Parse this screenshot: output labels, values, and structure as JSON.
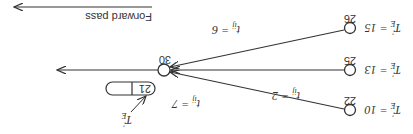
{
  "diagram": {
    "orientation": "rotated 180 degrees",
    "header": {
      "label": "Forward pass"
    },
    "target_node": {
      "id": "30"
    },
    "source_nodes": [
      {
        "id": "22",
        "te_label": "T'E = 10",
        "te_value": "10",
        "edge_label": "tij = 7",
        "duration": "7"
      },
      {
        "id": "25",
        "te_label": "T'E = 13",
        "te_value": "13",
        "edge_label": "tij = 2",
        "duration": "2"
      },
      {
        "id": "26",
        "te_label": "T'E = 15",
        "te_value": "15",
        "edge_label": "tij = 6",
        "duration": "6"
      }
    ],
    "result_box": {
      "value": "21",
      "second_value": "",
      "pointer_label": "T'E"
    },
    "colors": {
      "stroke": "#333333",
      "background": "#ffffff"
    }
  }
}
